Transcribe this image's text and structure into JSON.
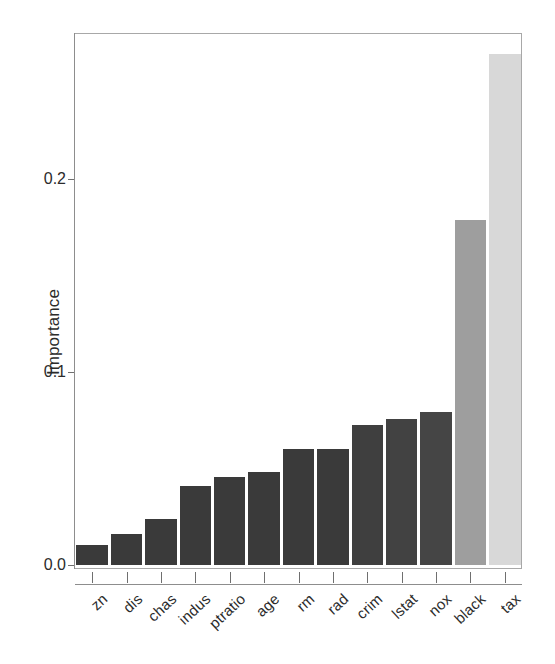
{
  "chart_data": {
    "type": "bar",
    "title": "",
    "subtitle": "",
    "xlabel": "",
    "ylabel": "Importance",
    "categories": [
      "zn",
      "dis",
      "chas",
      "indus",
      "ptratio",
      "age",
      "rm",
      "rad",
      "crim",
      "lstat",
      "nox",
      "black",
      "tax"
    ],
    "values": [
      0.0105,
      0.0162,
      0.0241,
      0.0409,
      0.0456,
      0.0482,
      0.0602,
      0.0602,
      0.0728,
      0.0759,
      0.0791,
      0.1786,
      0.2649
    ],
    "bar_colors": [
      "#3a3a3a",
      "#3a3a3a",
      "#3a3a3a",
      "#3a3a3a",
      "#3a3a3a",
      "#3a3a3a",
      "#3a3a3a",
      "#3a3a3a",
      "#3f3f3f",
      "#424242",
      "#454545",
      "#9e9e9e",
      "#d8d8d8"
    ],
    "ylim": [
      0.0,
      0.2805
    ],
    "ytick_labels": [
      "0.0",
      "0.1",
      "0.2"
    ],
    "ytick_values": [
      0.0,
      0.1,
      0.2
    ],
    "grid": false,
    "legend": null,
    "legend_position": "none",
    "annotations": []
  },
  "axes": {
    "y_title": "Importance"
  }
}
